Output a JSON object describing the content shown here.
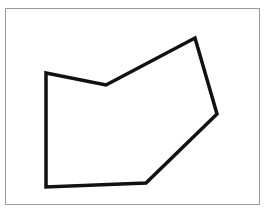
{
  "diagram": {
    "type": "polygon",
    "shape_name": "irregular-hexagon",
    "vertex_count": 6,
    "frame": {
      "border_color": "#9a9a9a",
      "background": "#ffffff"
    },
    "polygon": {
      "stroke_color": "#111111",
      "stroke_width": 3.5,
      "fill": "none",
      "points": "46,73 106,85 195,38 217,114 146,183 46,187"
    }
  }
}
